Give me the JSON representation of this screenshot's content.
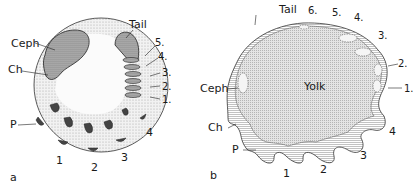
{
  "panels": [
    {
      "id": "a",
      "label": "a",
      "structures": {
        "ceph": "Ceph",
        "ch": "Ch",
        "p": "P",
        "tail": "Tail"
      },
      "pharyngeal_arches": [
        "1",
        "2",
        "3",
        "4"
      ],
      "somites": [
        "1.",
        "2.",
        "3.",
        "4.",
        "5."
      ]
    },
    {
      "id": "b",
      "label": "b",
      "structures": {
        "ceph": "Ceph",
        "ch": "Ch",
        "p": "P",
        "tail": "Tail",
        "yolk": "Yolk"
      },
      "pharyngeal_arches": [
        "1",
        "2",
        "3",
        "4"
      ],
      "somites": [
        "1.",
        "2.",
        "3.",
        "4.",
        "5.",
        "6."
      ]
    }
  ],
  "colors": {
    "ink": "#1a1a1a",
    "stipple_light": "#e6e6e6",
    "stipple_dark": "#8a8a8a",
    "yolk": "#d8d8d8",
    "hatch": "#9a9a9a"
  }
}
